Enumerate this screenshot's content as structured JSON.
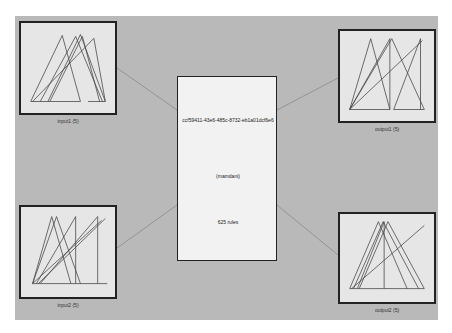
{
  "system": {
    "name": "ccf59411-43e6-485c-8732-eb1a01dcf6e6",
    "type": "(mamdani)",
    "rules": "625 rules"
  },
  "inputs": [
    {
      "label": "input1 (5)"
    },
    {
      "label": "input2 (5)"
    }
  ],
  "outputs": [
    {
      "label": "output1 (5)"
    },
    {
      "label": "output2 (5)"
    }
  ],
  "colors": {
    "background": "#b9b9b9",
    "panel": "#e6e6e6",
    "center": "#f2f2f2",
    "line": "#333333"
  }
}
